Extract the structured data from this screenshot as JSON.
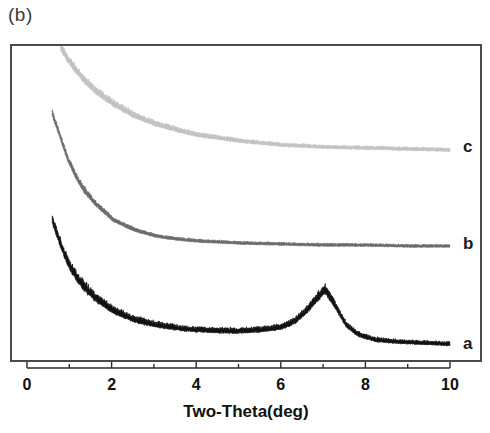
{
  "figure": {
    "panel_label": "(b)",
    "background_color": "#ffffff",
    "frame_color": "#4a4a4a"
  },
  "chart_data": {
    "type": "line",
    "title": "(b)",
    "xlabel": "Two-Theta(deg)",
    "ylabel": "",
    "xlim": [
      0,
      10
    ],
    "xticks": [
      0,
      2,
      4,
      6,
      8,
      10
    ],
    "xtick_labels": [
      "0",
      "2",
      "4",
      "6",
      "8",
      "10"
    ],
    "minor_xticks": [
      1,
      3,
      5,
      7,
      9
    ],
    "grid": false,
    "legend_position": "right-inline",
    "y_axis_visible": false,
    "note": "Small-angle XRD patterns; intensity in arbitrary units, curves vertically offset",
    "series": [
      {
        "name": "a",
        "label": "a",
        "color": "#111111",
        "label_x": 463,
        "label_y": 345,
        "noise_amplitude": 7.0,
        "x_start": 0.55,
        "x_end": 9.95,
        "baseline_y": 345,
        "start_y": 218,
        "decay_rate": 3.2,
        "decay_span": 118,
        "peak": {
          "center": 7.0,
          "height": 52,
          "width": 0.62,
          "shoulder_center": 6.3,
          "shoulder_height": 14,
          "shoulder_width": 1.4
        },
        "x": [
          0.55,
          0.7,
          0.9,
          1.1,
          1.3,
          1.6,
          2.0,
          2.5,
          3.0,
          3.5,
          4.0,
          4.5,
          5.0,
          5.5,
          6.0,
          6.3,
          6.6,
          6.8,
          7.0,
          7.2,
          7.5,
          7.8,
          8.2,
          8.8,
          9.4,
          9.95
        ],
        "y": [
          127,
          108,
          86,
          71,
          60,
          48,
          36,
          27,
          22,
          19,
          17,
          16,
          16,
          17,
          20,
          26,
          38,
          48,
          57,
          44,
          22,
          12,
          7,
          5,
          4,
          3
        ]
      },
      {
        "name": "b",
        "label": "b",
        "color": "#6a6a6a",
        "label_x": 463,
        "label_y": 245,
        "noise_amplitude": 4.5,
        "x_start": 0.55,
        "x_end": 9.95,
        "baseline_y": 248,
        "start_y": 112,
        "decay_rate": 2.4,
        "decay_span": 128,
        "peak": null,
        "x": [
          0.55,
          0.7,
          0.9,
          1.1,
          1.3,
          1.6,
          2.0,
          2.5,
          3.0,
          3.5,
          4.0,
          5.0,
          6.0,
          7.0,
          8.0,
          9.0,
          9.95
        ],
        "y": [
          136,
          118,
          93,
          74,
          60,
          45,
          30,
          20,
          14,
          11,
          9,
          7,
          6,
          5,
          5,
          4,
          4
        ]
      },
      {
        "name": "c",
        "label": "c",
        "color": "#c2c2c2",
        "label_x": 463,
        "label_y": 148,
        "noise_amplitude": 5.5,
        "x_start": 0.75,
        "x_end": 9.95,
        "baseline_y": 152,
        "start_y": 46,
        "decay_rate": 1.05,
        "decay_span": 106,
        "peak": null,
        "x": [
          0.75,
          0.9,
          1.1,
          1.3,
          1.6,
          2.0,
          2.5,
          3.0,
          3.5,
          4.0,
          4.5,
          5.0,
          6.0,
          7.0,
          8.0,
          9.0,
          9.95
        ],
        "y": [
          106,
          96,
          84,
          74,
          62,
          50,
          38,
          30,
          24,
          19,
          16,
          13,
          9,
          7,
          6,
          5,
          4
        ]
      }
    ]
  },
  "geometry": {
    "plot_left": 10,
    "plot_top": 44,
    "plot_width": 472,
    "plot_height": 318,
    "axis_x_min_px": 17,
    "axis_x_max_px": 440,
    "curve_x_min_px": 17,
    "curve_x_max_px": 440
  }
}
